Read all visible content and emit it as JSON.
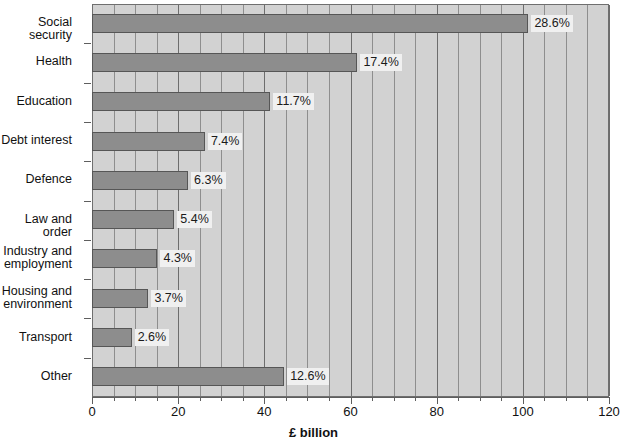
{
  "chart_data": {
    "type": "bar",
    "orientation": "horizontal",
    "title": "",
    "xlabel": "£ billion",
    "ylabel": "",
    "xlim": [
      0,
      120
    ],
    "xticks": [
      0,
      20,
      40,
      60,
      80,
      100,
      120
    ],
    "xtick_labels": [
      "0",
      "20",
      "40",
      "60",
      "80",
      "100",
      "120"
    ],
    "minor_tick_step": 5,
    "grid": true,
    "legend": false,
    "categories": [
      "Social security",
      "Health",
      "Education",
      "Debt interest",
      "Defence",
      "Law and order",
      "Industry and\nemployment",
      "Housing and\nenvironment",
      "Transport",
      "Other"
    ],
    "values": [
      101.3,
      61.6,
      41.4,
      26.2,
      22.3,
      19.1,
      15.2,
      13.1,
      9.2,
      44.6
    ],
    "data_labels": [
      "28.6%",
      "17.4%",
      "11.7%",
      "7.4%",
      "6.3%",
      "5.4%",
      "4.3%",
      "3.7%",
      "2.6%",
      "12.6%"
    ],
    "percentages": [
      28.6,
      17.4,
      11.7,
      7.4,
      6.3,
      5.4,
      4.3,
      3.7,
      2.6,
      12.6
    ],
    "colors": {
      "bar_fill": "#8d8d8d",
      "bar_border": "#565656",
      "plot_background": "#d2d2d2",
      "gridline": "#8e8e8e",
      "axis": "#5e5e5e",
      "label_background": "#f0f0f0",
      "text": "#111111"
    }
  }
}
